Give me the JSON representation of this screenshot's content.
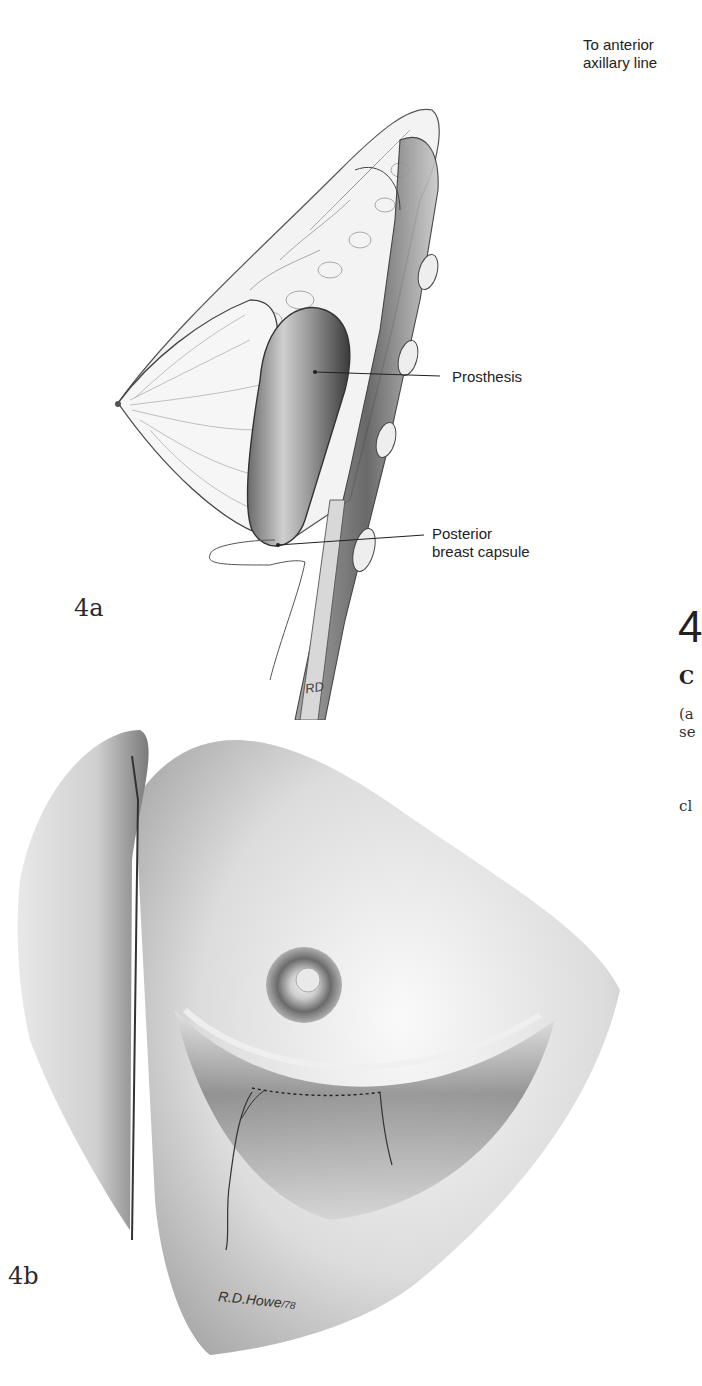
{
  "figure_4a": {
    "label": "4a",
    "annotations": {
      "top_right": [
        "To anterior",
        "axillary line"
      ],
      "prosthesis": "Prosthesis",
      "capsule": [
        "Posterior",
        "breast capsule"
      ]
    },
    "artist_initials": "RD"
  },
  "figure_4b": {
    "label": "4b",
    "signature": "R.D.Howe",
    "signature_year": "/78"
  },
  "right_column": {
    "heading_number": "4",
    "heading_initial": "C",
    "text_line1": "(a",
    "text_line2": "se",
    "text_line3": "cl"
  },
  "colors": {
    "ink": "#222222",
    "shade_dark": "#4a4a4a",
    "shade_mid": "#8a8a8a",
    "shade_light": "#d6d6d6",
    "paper": "#ffffff"
  }
}
